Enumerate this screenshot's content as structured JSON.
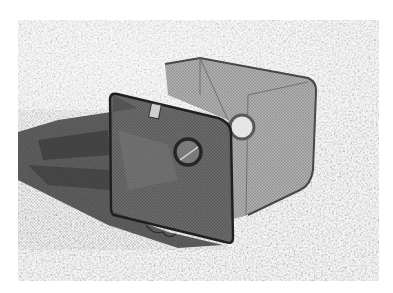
{
  "image": {
    "description": "Grayscale photograph of a collapsible mesh fish/crayfish trap resting on gravel, casting a long shadow to the left",
    "subject": "mesh trap",
    "background": "gravel ground",
    "colors": {
      "page_background": "#ffffff",
      "gravel_light": "#d9d9d9",
      "gravel_dark": "#8a8a8a",
      "shadow": "#4a4a4a",
      "mesh": "#6e6e6e",
      "frame": "#2a2a2a",
      "back_mesh": "#a8a8a8"
    }
  }
}
